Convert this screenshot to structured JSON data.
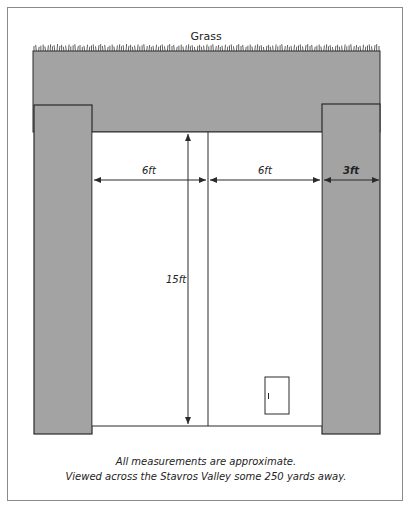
{
  "diagram": {
    "title": "Grass",
    "labels": {
      "left_width": "6ft",
      "right_width": "6ft",
      "pillar_width": "3ft",
      "height": "15ft",
      "door_mark": "I"
    },
    "caption": {
      "line1": "All measurements are approximate.",
      "line2": "Viewed across the Stavros Valley some 250 yards away."
    },
    "colors": {
      "stone": "#a3a3a3",
      "outline": "#2a2a2a",
      "frame": "#8a8a8a"
    }
  }
}
